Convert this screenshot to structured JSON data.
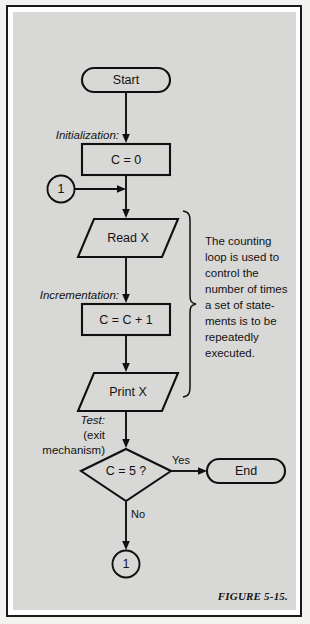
{
  "figure": {
    "caption": "FIGURE 5-15.",
    "panel_color": "#d8d8d6",
    "ink_color": "#101010"
  },
  "nodes": {
    "start": {
      "label": "Start",
      "shape": "terminator"
    },
    "initialize": {
      "label": "C = 0",
      "shape": "process"
    },
    "connector_in": {
      "label": "1",
      "shape": "connector"
    },
    "read": {
      "label": "Read X",
      "shape": "input-output"
    },
    "increment": {
      "label": "C = C + 1",
      "shape": "process"
    },
    "print": {
      "label": "Print X",
      "shape": "input-output"
    },
    "decision": {
      "label": "C = 5 ?",
      "shape": "decision"
    },
    "end": {
      "label": "End",
      "shape": "terminator"
    },
    "connector_out": {
      "label": "1",
      "shape": "connector"
    }
  },
  "phase_labels": {
    "initialization": "Initialization:",
    "incrementation": "Incrementation:",
    "test": "Test:",
    "test_sub": "(exit",
    "test_sub2": "mechanism)"
  },
  "branch_labels": {
    "yes": "Yes",
    "no": "No"
  },
  "annotation": {
    "lines": [
      "The counting",
      "loop is used to",
      "control the",
      "number of times",
      "a set of state-",
      "ments is to be",
      "repeatedly",
      "executed."
    ]
  }
}
